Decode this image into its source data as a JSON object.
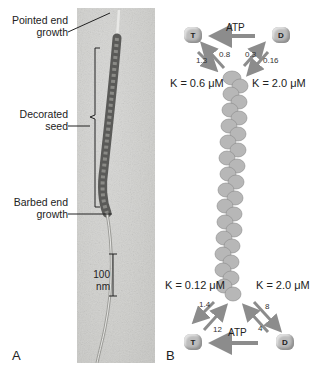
{
  "panel_a": {
    "letter": "A",
    "labels": {
      "pointed_end_line1": "Pointed end",
      "pointed_end_line2": "growth",
      "decorated_line1": "Decorated",
      "decorated_line2": "seed",
      "barbed_end_line1": "Barbed end",
      "barbed_end_line2": "growth"
    },
    "scale_bar": "100 nm"
  },
  "panel_b": {
    "letter": "B",
    "top": {
      "atp_label": "ATP",
      "monomer_t": "T",
      "monomer_d": "D",
      "rates": {
        "t_on": "1.3",
        "t_off": "0.8",
        "d_on": "0.3",
        "d_off": "0.16"
      },
      "k_t": "K = 0.6 μM",
      "k_d": "K = 2.0 μM"
    },
    "bottom": {
      "atp_label": "ATP",
      "monomer_t": "T",
      "monomer_d": "D",
      "rates": {
        "t_off": "1.4",
        "t_on": "12",
        "d_off": "8",
        "d_on": "4"
      },
      "k_t": "K = 0.12 μM",
      "k_d": "K = 2.0 μM"
    }
  }
}
